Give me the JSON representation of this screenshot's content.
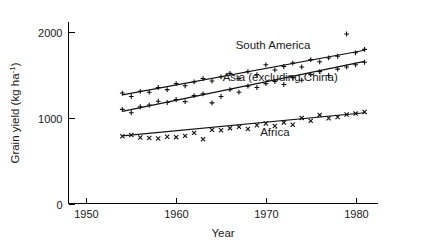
{
  "chart_data": {
    "type": "scatter",
    "title": "",
    "xlabel": "Year",
    "ylabel": "Grain yield (kg ha",
    "ylabel_exponent": "-1",
    "ylabel_close": ")",
    "xlim": [
      1948,
      1982.5
    ],
    "ylim": [
      0,
      2120
    ],
    "grid": false,
    "legend_position": "inline-annotations",
    "xticks": [
      1950,
      1960,
      1970,
      1980
    ],
    "xtick_labels": [
      "1950",
      "1960",
      "1970",
      "1980"
    ],
    "yticks": [
      0,
      1000,
      2000
    ],
    "ytick_labels": [
      "0",
      "1000",
      "2000"
    ],
    "series": [
      {
        "name": "South America",
        "marker": "plus",
        "label": "South America",
        "label_x": 1970.8,
        "label_y": 1810,
        "trend": {
          "x": [
            1954,
            1981
          ],
          "y": [
            1270,
            1790
          ]
        },
        "x": [
          1954,
          1955,
          1956,
          1957,
          1958,
          1959,
          1960,
          1961,
          1962,
          1963,
          1964,
          1965,
          1966,
          1967,
          1968,
          1969,
          1970,
          1971,
          1972,
          1973,
          1974,
          1975,
          1976,
          1977,
          1978,
          1979,
          1980,
          1981
        ],
        "y": [
          1290,
          1250,
          1310,
          1300,
          1355,
          1330,
          1400,
          1375,
          1420,
          1460,
          1430,
          1480,
          1520,
          1460,
          1540,
          1505,
          1620,
          1560,
          1600,
          1640,
          1595,
          1680,
          1655,
          1700,
          1720,
          1980,
          1760,
          1800
        ]
      },
      {
        "name": "Asia (excluding China)",
        "marker": "plus",
        "label": "Asia (excluding China)",
        "label_x": 1971.6,
        "label_y": 1430,
        "trend": {
          "x": [
            1954,
            1981
          ],
          "y": [
            1075,
            1660
          ]
        },
        "x": [
          1954,
          1955,
          1956,
          1957,
          1958,
          1959,
          1960,
          1961,
          1962,
          1963,
          1964,
          1965,
          1966,
          1967,
          1968,
          1969,
          1970,
          1971,
          1972,
          1973,
          1974,
          1975,
          1976,
          1977,
          1978,
          1979,
          1980,
          1981
        ],
        "y": [
          1100,
          1060,
          1130,
          1150,
          1195,
          1180,
          1215,
          1190,
          1260,
          1280,
          1175,
          1250,
          1330,
          1300,
          1370,
          1355,
          1400,
          1425,
          1390,
          1470,
          1440,
          1505,
          1540,
          1495,
          1570,
          1595,
          1620,
          1650
        ]
      },
      {
        "name": "Africa",
        "marker": "cross",
        "label": "Africa",
        "label_x": 1971.0,
        "label_y": 790,
        "trend": {
          "x": [
            1954,
            1981
          ],
          "y": [
            790,
            1060
          ]
        },
        "x": [
          1954,
          1955,
          1956,
          1957,
          1958,
          1959,
          1960,
          1961,
          1962,
          1963,
          1964,
          1965,
          1966,
          1967,
          1968,
          1969,
          1970,
          1971,
          1972,
          1973,
          1974,
          1975,
          1976,
          1977,
          1978,
          1979,
          1980,
          1981
        ],
        "y": [
          785,
          800,
          770,
          765,
          760,
          780,
          775,
          790,
          825,
          750,
          860,
          855,
          880,
          895,
          870,
          915,
          935,
          905,
          945,
          920,
          1000,
          965,
          1035,
          995,
          1010,
          1040,
          1050,
          1070
        ]
      }
    ]
  }
}
